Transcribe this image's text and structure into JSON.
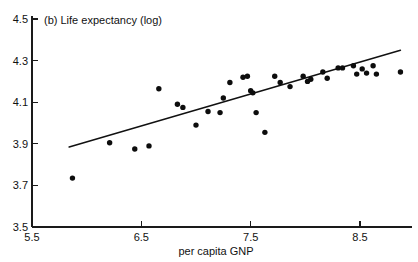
{
  "chart_data": {
    "type": "scatter",
    "title": "(b) Life expectancy (log)",
    "xlabel": "per capita GNP",
    "ylabel": "",
    "xlim": [
      5.5,
      8.9
    ],
    "ylim": [
      3.5,
      4.5
    ],
    "xticks": [
      5.5,
      6.5,
      7.5,
      8.5
    ],
    "xtick_labels": [
      "5.5",
      "6.5",
      "7.5",
      "8.5"
    ],
    "yticks": [
      3.5,
      3.7,
      3.9,
      4.1,
      4.3,
      4.5
    ],
    "ytick_labels": [
      "3.5",
      "3.7",
      "3.9",
      "4.1",
      "4.3",
      "4.5"
    ],
    "grid": false,
    "legend": null,
    "marker": "filled-circle",
    "marker_color": "#0d0d0d",
    "points": [
      {
        "x": 5.87,
        "y": 3.735
      },
      {
        "x": 6.21,
        "y": 3.905
      },
      {
        "x": 6.44,
        "y": 3.875
      },
      {
        "x": 6.57,
        "y": 3.89
      },
      {
        "x": 6.66,
        "y": 4.165
      },
      {
        "x": 6.83,
        "y": 4.09
      },
      {
        "x": 6.88,
        "y": 4.075
      },
      {
        "x": 7.0,
        "y": 3.99
      },
      {
        "x": 7.11,
        "y": 4.055
      },
      {
        "x": 7.22,
        "y": 4.05
      },
      {
        "x": 7.25,
        "y": 4.12
      },
      {
        "x": 7.31,
        "y": 4.195
      },
      {
        "x": 7.43,
        "y": 4.22
      },
      {
        "x": 7.47,
        "y": 4.225
      },
      {
        "x": 7.5,
        "y": 4.155
      },
      {
        "x": 7.52,
        "y": 4.145
      },
      {
        "x": 7.55,
        "y": 4.05
      },
      {
        "x": 7.63,
        "y": 3.955
      },
      {
        "x": 7.72,
        "y": 4.225
      },
      {
        "x": 7.77,
        "y": 4.195
      },
      {
        "x": 7.86,
        "y": 4.175
      },
      {
        "x": 7.98,
        "y": 4.225
      },
      {
        "x": 8.02,
        "y": 4.2
      },
      {
        "x": 8.05,
        "y": 4.21
      },
      {
        "x": 8.16,
        "y": 4.245
      },
      {
        "x": 8.2,
        "y": 4.215
      },
      {
        "x": 8.3,
        "y": 4.265
      },
      {
        "x": 8.34,
        "y": 4.265
      },
      {
        "x": 8.44,
        "y": 4.275
      },
      {
        "x": 8.47,
        "y": 4.235
      },
      {
        "x": 8.52,
        "y": 4.26
      },
      {
        "x": 8.56,
        "y": 4.24
      },
      {
        "x": 8.62,
        "y": 4.275
      },
      {
        "x": 8.65,
        "y": 4.235
      },
      {
        "x": 8.87,
        "y": 4.245
      }
    ],
    "fit_line": {
      "label": "regression-line",
      "x0": 5.84,
      "y0": 3.885,
      "x1": 8.87,
      "y1": 4.35
    }
  },
  "axes": {
    "y_axis_name": "y-axis",
    "x_axis_name": "x-axis"
  }
}
